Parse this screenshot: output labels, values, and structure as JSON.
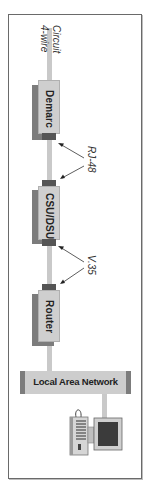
{
  "diagram": {
    "orientation": "rotated-90-clockwise",
    "circuit_label": {
      "line1": "4-wire",
      "line2": "Circuit"
    },
    "devices": [
      {
        "id": "demarc",
        "label": "Demarc"
      },
      {
        "id": "csu-dsu",
        "label": "CSU/DSU"
      },
      {
        "id": "router",
        "label": "Router"
      }
    ],
    "interfaces": [
      {
        "id": "rj48",
        "label": "RJ-48",
        "between": [
          "Demarc",
          "CSU/DSU"
        ]
      },
      {
        "id": "v35",
        "label": "V.35",
        "between": [
          "CSU/DSU",
          "Router"
        ]
      }
    ],
    "network": {
      "label": "Local Area Network"
    },
    "endpoint": {
      "type": "computer-icon"
    },
    "colors": {
      "device_fill": "#cfcfcf",
      "device_shadow": "#7c7c7c",
      "connector": "#555555",
      "line": "#c9c9c9",
      "frame": "#6a6a6a"
    }
  }
}
